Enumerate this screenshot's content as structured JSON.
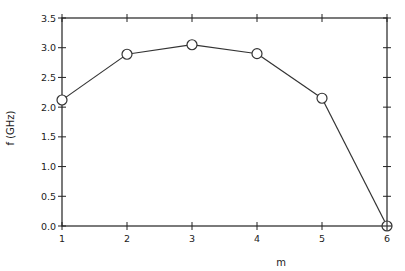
{
  "chart_data": {
    "type": "line",
    "title": "",
    "xlabel": "m",
    "ylabel": "f (GHz)",
    "xlim": [
      1,
      6
    ],
    "ylim": [
      0.0,
      3.5
    ],
    "x_ticks": [
      "1",
      "2",
      "3",
      "4",
      "5",
      "6"
    ],
    "y_ticks": [
      "0.0",
      "0.5",
      "1.0",
      "1.5",
      "2.0",
      "2.5",
      "3.0",
      "3.5"
    ],
    "grid": false,
    "legend": null,
    "marker": "open-circle",
    "last_marker": "crossed-circle",
    "series": [
      {
        "name": "f",
        "x": [
          1,
          2,
          3,
          4,
          5,
          6
        ],
        "values": [
          2.12,
          2.89,
          3.05,
          2.9,
          2.15,
          0.0
        ]
      }
    ]
  },
  "colors": {
    "line": "#333333",
    "axis": "#222222",
    "background": "#ffffff"
  }
}
